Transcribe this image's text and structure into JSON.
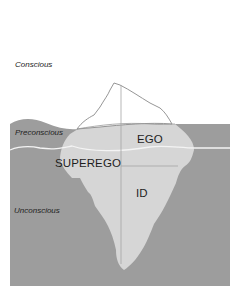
{
  "diagram": {
    "type": "iceberg-model-of-mind",
    "zones": [
      {
        "id": "conscious",
        "label": "Conscious"
      },
      {
        "id": "preconscious",
        "label": "Preconscious"
      },
      {
        "id": "unconscious",
        "label": "Unconscious"
      }
    ],
    "structures": [
      {
        "id": "ego",
        "label": "EGO"
      },
      {
        "id": "superego",
        "label": "SUPEREGO"
      },
      {
        "id": "id",
        "label": "ID"
      }
    ],
    "colors": {
      "background": "#ffffff",
      "water": "#9d9d9d",
      "iceberg_submerged": "#d6d6d6",
      "iceberg_tip": "#ffffff",
      "outline": "#8a8a8a",
      "waterline": "#f4f4f4",
      "text": "#1e1e1e"
    }
  }
}
